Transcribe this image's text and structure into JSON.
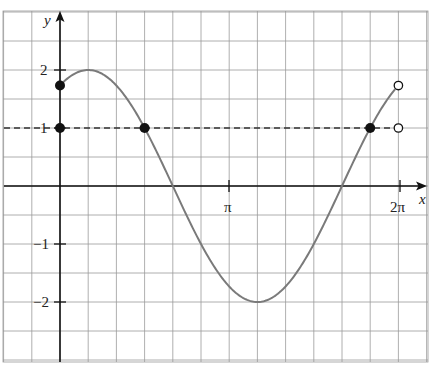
{
  "chart_data": {
    "type": "line",
    "title": "",
    "function_description": "y = 2 sin(x + π/3) on [0, 2π)",
    "xlabel": "x",
    "ylabel": "y",
    "xlim": [
      -0.55,
      7.0
    ],
    "ylim": [
      -3.0,
      3.0
    ],
    "grid": true,
    "grid_step_x": "π/6",
    "grid_step_y": 0.5,
    "x_ticks": [
      {
        "value": 3.14159,
        "label": "π"
      },
      {
        "value": 6.28319,
        "label": "2π"
      }
    ],
    "y_ticks": [
      {
        "value": 2,
        "label": "2"
      },
      {
        "value": 1,
        "label": "1"
      },
      {
        "value": -1,
        "label": "−1"
      },
      {
        "value": -2,
        "label": "−2"
      }
    ],
    "series": [
      {
        "name": "curve",
        "color": "#7a7a7a",
        "x": [
          0,
          0.5236,
          1.5708,
          2.0944,
          3.6652,
          5.236,
          5.7596,
          6.2832
        ],
        "x_labels": [
          "0",
          "π/6",
          "π/2",
          "2π/3",
          "7π/6",
          "5π/3",
          "11π/6",
          "2π"
        ],
        "y": [
          1.732,
          2,
          1,
          0,
          -2,
          0,
          1,
          1.732
        ]
      },
      {
        "name": "dashed line y=1",
        "color": "#333333",
        "style": "dashed",
        "x": [
          -0.55,
          6.2832
        ],
        "y": [
          1,
          1
        ]
      }
    ],
    "points": [
      {
        "x": 0,
        "y": 1.732,
        "filled": true,
        "label": "(0, √3)"
      },
      {
        "x": 0,
        "y": 1,
        "filled": true,
        "label": "(0, 1)"
      },
      {
        "x": 1.5708,
        "y": 1,
        "filled": true,
        "label": "(π/2, 1)"
      },
      {
        "x": 5.7596,
        "y": 1,
        "filled": true,
        "label": "(11π/6, 1)"
      },
      {
        "x": 6.2832,
        "y": 1.732,
        "filled": false,
        "label": "(2π, √3)"
      },
      {
        "x": 6.2832,
        "y": 1,
        "filled": false,
        "label": "(2π, 1)"
      }
    ]
  },
  "labels": {
    "x_axis": "x",
    "y_axis": "y",
    "pi": "π",
    "two_pi": "2π",
    "y2": "2",
    "y1": "1",
    "ym1": "−1",
    "ym2": "−2"
  },
  "colors": {
    "grid": "#9a9a9a",
    "axis": "#111111",
    "curve": "#7a7a7a",
    "dash": "#333333",
    "point": "#111111"
  }
}
